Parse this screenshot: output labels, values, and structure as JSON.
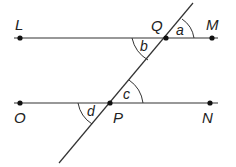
{
  "diagram": {
    "points": {
      "L": "L",
      "Q": "Q",
      "M": "M",
      "O": "O",
      "P": "P",
      "N": "N"
    },
    "angles": {
      "a": "a",
      "b": "b",
      "c": "c",
      "d": "d"
    },
    "line_color": "#333333",
    "text_color": "#222222"
  }
}
